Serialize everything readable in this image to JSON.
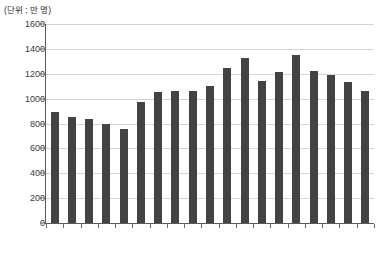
{
  "unit_label": "(단위 : 만 명)",
  "colors": {
    "bar": "#434343",
    "grid": "#d5d5d5",
    "axis": "#5a5a5a",
    "text": "#333333",
    "background": "#ffffff"
  },
  "chart_data": {
    "type": "bar",
    "title": "",
    "subtitle": "",
    "xlabel": "",
    "ylabel": "",
    "unit_note": "(단위 : 만 명)",
    "categories": [
      "1996",
      "1997",
      "1998",
      "1999",
      "2000",
      "2001",
      "2002",
      "2003",
      "2004",
      "2005",
      "2006",
      "2007",
      "2008",
      "2009",
      "2010",
      "2011",
      "2012",
      "2013",
      "2014"
    ],
    "values": [
      890,
      850,
      840,
      800,
      755,
      970,
      1050,
      1060,
      1065,
      1100,
      1245,
      1330,
      1145,
      1215,
      1350,
      1220,
      1190,
      1135,
      1065
    ],
    "ylim": [
      0,
      1600
    ],
    "yticks": [
      0,
      200,
      400,
      600,
      800,
      1000,
      1200,
      1400,
      1600
    ],
    "ytick_labels": [
      "0",
      "200",
      "400",
      "600",
      "800",
      "1000",
      "1200",
      "1400",
      "1600"
    ],
    "grid": true,
    "grid_axis": "y",
    "legend": null,
    "legend_position": "none",
    "xtick_rotation": -90
  }
}
